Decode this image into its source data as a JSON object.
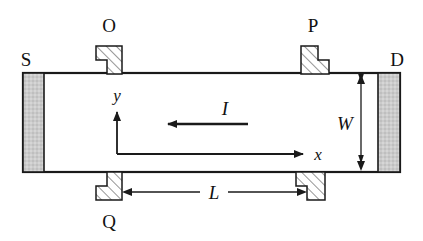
{
  "figure": {
    "kind": "device-cross-section-diagram",
    "background_color": "#ffffff",
    "line_color": "#1a1a1a",
    "electrode_fill": "#c9c9c9",
    "contact_fill": "#ffffff",
    "hatch_color": "#555555"
  },
  "labels": {
    "source": "S",
    "drain": "D",
    "probe_top_left": "O",
    "probe_top_right": "P",
    "probe_bottom_left": "Q",
    "axis_x": "x",
    "axis_y": "y",
    "current": "I",
    "width": "W",
    "length": "L"
  },
  "geometry": {
    "channel": {
      "x": 23,
      "y": 73,
      "width": 377,
      "height": 99
    },
    "source_electrode": {
      "x": 23,
      "y": 73,
      "width": 21,
      "height": 99
    },
    "drain_electrode": {
      "x": 378,
      "y": 73,
      "width": 22,
      "height": 99
    },
    "origin": {
      "x": 117,
      "y": 154
    },
    "x_axis_tip": {
      "x": 312,
      "y": 154
    },
    "y_axis_tip": {
      "x": 117,
      "y": 107
    },
    "current_arrow": {
      "from_x": 248,
      "to_x": 160,
      "y": 124
    },
    "width_arrow": {
      "x": 361,
      "top_y": 75,
      "bottom_y": 170
    },
    "length_arrow": {
      "left_x": 122,
      "right_x": 307,
      "y": 192
    }
  },
  "contacts": [
    {
      "name": "O",
      "position": "top-left",
      "label_x": 109,
      "label_y": 26
    },
    {
      "name": "P",
      "position": "top-right",
      "label_x": 313,
      "label_y": 26
    },
    {
      "name": "Q",
      "position": "bottom-left",
      "label_x": 109,
      "label_y": 228
    },
    {
      "name": "unlabeled",
      "position": "bottom-right",
      "label_x": null,
      "label_y": null
    }
  ]
}
